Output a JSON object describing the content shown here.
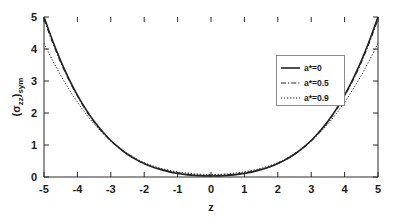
{
  "chart_data": {
    "type": "line",
    "title": "",
    "xlabel": "z",
    "ylabel": "(σzz)sym",
    "ylabel_base": "(σ",
    "ylabel_sub1": "zz",
    "ylabel_mid": ")",
    "ylabel_sub2": "sym",
    "xlim": [
      -5,
      5
    ],
    "ylim": [
      0,
      5
    ],
    "xticks": [
      -5,
      -4,
      -3,
      -2,
      -1,
      0,
      1,
      2,
      3,
      4,
      5
    ],
    "xticklabels": [
      "-5",
      "-4",
      "-3",
      "-2",
      "-1",
      "0",
      "1",
      "2",
      "3",
      "4",
      "5"
    ],
    "yticks": [
      0,
      1,
      2,
      3,
      4,
      5
    ],
    "yticklabels": [
      "0",
      "1",
      "2",
      "3",
      "4",
      "5"
    ],
    "grid": false,
    "legend_position": "center-right",
    "series": [
      {
        "name": "a*=0",
        "label": "a*=0",
        "style": "solid",
        "color": "#242424",
        "width": 1.6,
        "x": [
          -5,
          -4.75,
          -4.5,
          -4.25,
          -4,
          -3.75,
          -3.5,
          -3.25,
          -3,
          -2.75,
          -2.5,
          -2.25,
          -2,
          -1.75,
          -1.5,
          -1.25,
          -1,
          -0.75,
          -0.5,
          -0.25,
          0,
          0.25,
          0.5,
          0.75,
          1,
          1.25,
          1.5,
          1.75,
          2,
          2.25,
          2.5,
          2.75,
          3,
          3.25,
          3.5,
          3.75,
          4,
          4.25,
          4.5,
          4.75,
          5
        ],
        "y": [
          5.0,
          4.28,
          3.63,
          3.06,
          2.56,
          2.12,
          1.74,
          1.42,
          1.14,
          0.91,
          0.71,
          0.55,
          0.42,
          0.31,
          0.23,
          0.16,
          0.11,
          0.075,
          0.05,
          0.035,
          0.03,
          0.035,
          0.05,
          0.075,
          0.11,
          0.16,
          0.23,
          0.31,
          0.42,
          0.55,
          0.71,
          0.91,
          1.14,
          1.42,
          1.74,
          2.12,
          2.56,
          3.06,
          3.63,
          4.28,
          5.0
        ]
      },
      {
        "name": "a*=0.5",
        "label": "a*=0.5",
        "style": "dashdot",
        "color": "#242424",
        "width": 1.1,
        "x": [
          -5,
          -4.75,
          -4.5,
          -4.25,
          -4,
          -3.75,
          -3.5,
          -3.25,
          -3,
          -2.75,
          -2.5,
          -2.25,
          -2,
          -1.75,
          -1.5,
          -1.25,
          -1,
          -0.75,
          -0.5,
          -0.25,
          0,
          0.25,
          0.5,
          0.75,
          1,
          1.25,
          1.5,
          1.75,
          2,
          2.25,
          2.5,
          2.75,
          3,
          3.25,
          3.5,
          3.75,
          4,
          4.25,
          4.5,
          4.75,
          5
        ],
        "y": [
          4.93,
          4.22,
          3.58,
          3.02,
          2.53,
          2.09,
          1.72,
          1.4,
          1.13,
          0.9,
          0.71,
          0.55,
          0.42,
          0.32,
          0.24,
          0.18,
          0.13,
          0.095,
          0.07,
          0.055,
          0.05,
          0.055,
          0.07,
          0.095,
          0.13,
          0.18,
          0.24,
          0.32,
          0.42,
          0.55,
          0.71,
          0.9,
          1.13,
          1.4,
          1.72,
          2.09,
          2.53,
          3.02,
          3.58,
          4.22,
          4.93
        ]
      },
      {
        "name": "a*=0.9",
        "label": "a*=0.9",
        "style": "dotted",
        "color": "#242424",
        "width": 1.0,
        "x": [
          -5,
          -4.75,
          -4.5,
          -4.25,
          -4,
          -3.75,
          -3.5,
          -3.25,
          -3,
          -2.75,
          -2.5,
          -2.25,
          -2,
          -1.75,
          -1.5,
          -1.25,
          -1,
          -0.75,
          -0.5,
          -0.25,
          0,
          0.25,
          0.5,
          0.75,
          1,
          1.25,
          1.5,
          1.75,
          2,
          2.25,
          2.5,
          2.75,
          3,
          3.25,
          3.5,
          3.75,
          4,
          4.25,
          4.5,
          4.75,
          5
        ],
        "y": [
          4.18,
          3.66,
          3.18,
          2.74,
          2.34,
          1.98,
          1.66,
          1.38,
          1.13,
          0.92,
          0.73,
          0.58,
          0.45,
          0.35,
          0.27,
          0.21,
          0.16,
          0.125,
          0.1,
          0.085,
          0.08,
          0.085,
          0.1,
          0.125,
          0.16,
          0.21,
          0.27,
          0.35,
          0.45,
          0.58,
          0.73,
          0.92,
          1.13,
          1.38,
          1.66,
          1.98,
          2.34,
          2.74,
          3.18,
          3.66,
          4.18
        ]
      }
    ]
  },
  "colors": {
    "background": "#ffffff",
    "frame": "#2b2b2b",
    "text": "#1a1a1a",
    "legend_border": "#8a8a8a",
    "curve": "#242424"
  }
}
